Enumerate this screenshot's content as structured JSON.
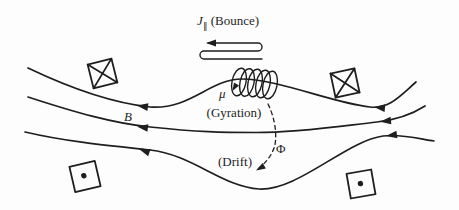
{
  "canvas": {
    "width": 459,
    "height": 210,
    "background": "#fdfdfd",
    "ink": "#1e1e1e"
  },
  "labels": {
    "bounce": {
      "symbol": "J",
      "subscript": "∥",
      "caption": "(Bounce)"
    },
    "gyration": {
      "symbol": "μ",
      "caption": "(Gyration)"
    },
    "field": {
      "symbol": "B"
    },
    "drift": {
      "symbol": "Φ",
      "caption": "(Drift)"
    }
  },
  "icons": {
    "current_into_page_symbol": "⊠",
    "current_out_of_page_symbol": "⊡"
  }
}
